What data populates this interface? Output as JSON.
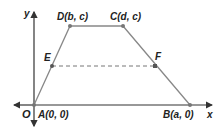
{
  "diagram": {
    "type": "trapezoid on coordinate plane",
    "axes": {
      "x_label": "x",
      "y_label": "y",
      "origin_label": "O"
    },
    "points": {
      "A": {
        "name": "A",
        "coords": "(0, 0)"
      },
      "B": {
        "name": "B",
        "coords": "(a, 0)"
      },
      "C": {
        "name": "C",
        "coords": "(d, c)"
      },
      "D": {
        "name": "D",
        "coords": "(b, c)"
      },
      "E": {
        "name": "E"
      },
      "F": {
        "name": "F"
      }
    },
    "segments": [
      {
        "from": "A",
        "to": "D",
        "style": "solid"
      },
      {
        "from": "D",
        "to": "C",
        "style": "solid"
      },
      {
        "from": "C",
        "to": "B",
        "style": "solid"
      },
      {
        "from": "E",
        "to": "F",
        "style": "dashed"
      }
    ],
    "colors": {
      "axis": "#333333",
      "shape": "#888888",
      "point": "#777777",
      "text": "#222222"
    }
  }
}
